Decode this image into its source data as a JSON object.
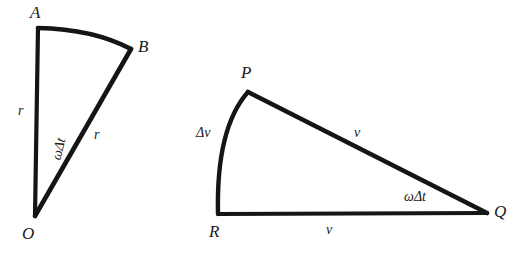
{
  "figure": {
    "background_color": "#ffffff",
    "stroke_color": "#151515",
    "text_color": "#1a1a1a",
    "stroke_width": 4,
    "panels": [
      {
        "id": "left-sector",
        "name": "radius-sector-OAB",
        "description": "Circular sector with center O and arc from A to B",
        "vertices": [
          {
            "name": "A",
            "label": "A",
            "x": 38,
            "y": 28,
            "label_x": 30,
            "label_y": 4
          },
          {
            "name": "B",
            "label": "B",
            "x": 131,
            "y": 49,
            "label_x": 138,
            "label_y": 38
          },
          {
            "name": "O",
            "label": "O",
            "x": 35,
            "y": 216,
            "label_x": 22,
            "label_y": 225
          }
        ],
        "edges": [
          {
            "name": "OA",
            "type": "line",
            "label": "r",
            "label_x": 18,
            "label_y": 104
          },
          {
            "name": "OB",
            "type": "line",
            "label": "r",
            "label_x": 94,
            "label_y": 128
          },
          {
            "name": "AB",
            "type": "arc",
            "label": "",
            "label_x": 0,
            "label_y": 0
          }
        ],
        "angle": {
          "name": "angle-AOB",
          "label": "ωΔt",
          "label_x": 48,
          "label_y": 142,
          "rotated": true
        }
      },
      {
        "id": "right-velocity",
        "name": "velocity-triangle-PQR",
        "description": "Velocity vector triangle with vertices P, Q, R and arc from R to P",
        "vertices": [
          {
            "name": "P",
            "label": "P",
            "x": 248,
            "y": 92,
            "label_x": 241,
            "label_y": 64
          },
          {
            "name": "Q",
            "label": "Q",
            "x": 487,
            "y": 213,
            "label_x": 494,
            "label_y": 203
          },
          {
            "name": "R",
            "label": "R",
            "x": 218,
            "y": 214,
            "label_x": 209,
            "label_y": 223
          }
        ],
        "edges": [
          {
            "name": "PQ",
            "type": "line",
            "label": "v",
            "label_x": 354,
            "label_y": 126
          },
          {
            "name": "RQ",
            "type": "line",
            "label": "v",
            "label_x": 326,
            "label_y": 223
          },
          {
            "name": "RP",
            "type": "arc",
            "label": "Δv",
            "label_x": 196,
            "label_y": 126
          }
        ],
        "angle": {
          "name": "angle-PQR",
          "label": "ωΔt",
          "label_x": 404,
          "label_y": 190,
          "rotated": false
        }
      }
    ]
  }
}
